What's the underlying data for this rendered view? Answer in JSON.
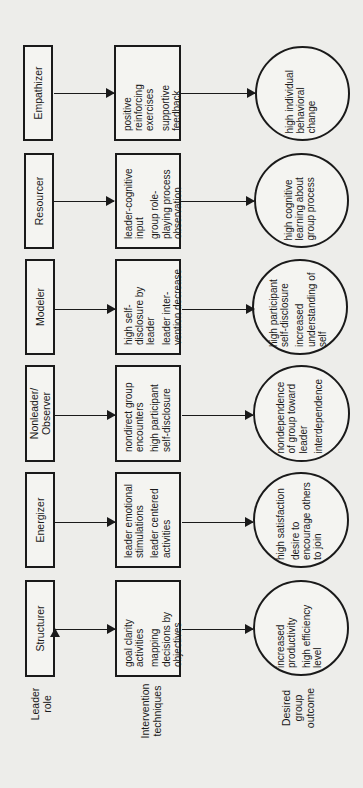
{
  "axis_labels": {
    "leader_role": [
      "Leader",
      "role"
    ],
    "intervention": [
      "Intervention",
      "techniques"
    ],
    "outcome": [
      "Desired",
      "group",
      "outcome"
    ]
  },
  "columns": [
    {
      "role": [
        "Structurer"
      ],
      "techniques": [
        "goal clarity activities",
        "mapping decisions by objectives"
      ],
      "outcome": [
        "increased productivity",
        "high efficiency level"
      ]
    },
    {
      "role": [
        "Energizer"
      ],
      "techniques": [
        "leader emotional stimulations",
        "leader centered activities"
      ],
      "outcome": [
        "high satisfaction",
        "desire to encourage others to join"
      ]
    },
    {
      "role": [
        "Nonleader/",
        "Observer"
      ],
      "techniques": [
        "nondirect group encounters",
        "high participant self-disclosure"
      ],
      "outcome": [
        "nondependence of group toward leader",
        "interdependence"
      ]
    },
    {
      "role": [
        "Modeler"
      ],
      "techniques": [
        "high self-disclosure by leader",
        "leader inter-vention decrease"
      ],
      "outcome": [
        "high participant self-disclosure",
        "increased understanding of self"
      ]
    },
    {
      "role": [
        "Resourcer"
      ],
      "techniques": [
        "leader-cognitive input",
        "group role-playing process observation"
      ],
      "outcome": [
        "high cognitive learning about group process"
      ]
    },
    {
      "role": [
        "Empathizer"
      ],
      "techniques": [
        "positive reinforcing exercises",
        "supportive feedback"
      ],
      "outcome": [
        "high individual behavioral change"
      ]
    }
  ]
}
